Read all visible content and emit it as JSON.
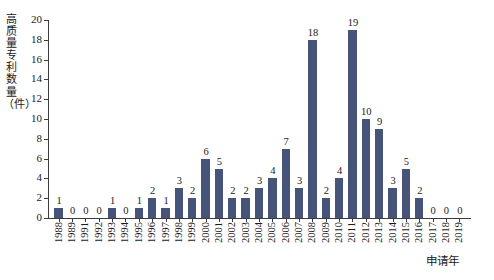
{
  "chart_data": {
    "type": "bar",
    "title": "",
    "xlabel": "申请年",
    "ylabel": "高质量专利数量（件）",
    "categories": [
      "1988",
      "1989",
      "1991",
      "1992",
      "1993",
      "1994",
      "1995",
      "1996",
      "1997",
      "1998",
      "1999",
      "2000",
      "2001",
      "2002",
      "2003",
      "2004",
      "2005",
      "2006",
      "2007",
      "2008",
      "2009",
      "2010",
      "2011",
      "2012",
      "2013",
      "2014",
      "2015",
      "2016",
      "2017",
      "2018",
      "2019"
    ],
    "values": [
      1,
      0,
      0,
      0,
      1,
      0,
      1,
      2,
      1,
      3,
      2,
      6,
      5,
      2,
      2,
      3,
      4,
      7,
      3,
      18,
      2,
      4,
      19,
      10,
      9,
      3,
      5,
      2,
      0,
      0,
      0
    ],
    "ylim": [
      0,
      20
    ],
    "ytick_step": 2,
    "yticks": [
      "0",
      "2",
      "4",
      "6",
      "8",
      "10",
      "12",
      "14",
      "16",
      "18",
      "20"
    ],
    "grid": false,
    "legend": null,
    "bar_color": "#46547a",
    "axis_color": "#3c3c3c",
    "background": "#ffffff",
    "show_value_labels": true
  }
}
